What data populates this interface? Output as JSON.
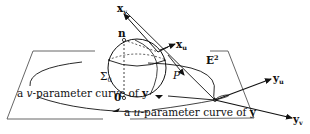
{
  "figure": {
    "colors": {
      "ink": "#111111",
      "plane": "#555555",
      "background": "#ffffff"
    }
  },
  "labels": {
    "x_v": "x",
    "x_v_sub": "v",
    "x_u": "x",
    "x_u_sub": "u",
    "n": "n",
    "sigma": "Σ",
    "sigma_sub": "0",
    "origin": "0",
    "P": "P",
    "E": "E",
    "E_sup": "2",
    "y_u": "y",
    "y_u_sub": "u",
    "y_v": "y",
    "y_v_sub": "v",
    "v_curve_prefix": "a ",
    "v_curve_var": "v",
    "v_curve_suffix": "-parameter curve of ",
    "v_curve_y": "y",
    "u_curve_prefix": "a ",
    "u_curve_var": "u",
    "u_curve_suffix": "-parameter curve of ",
    "u_curve_y": "y"
  }
}
